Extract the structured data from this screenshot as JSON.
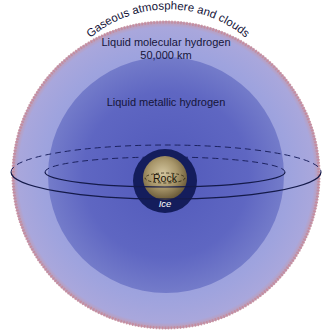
{
  "diagram": {
    "labels": {
      "atmosphere": "Gaseous atmosphere and clouds",
      "molecular": "Liquid molecular hydrogen",
      "depth": "50,000 km",
      "metallic": "Liquid metallic hydrogen",
      "rock": "Rock",
      "ice": "Ice"
    },
    "layers": [
      {
        "name": "Gaseous atmosphere and clouds",
        "color": "#c48a9a"
      },
      {
        "name": "Liquid molecular hydrogen",
        "color": "#9a9fdc"
      },
      {
        "name": "Liquid metallic hydrogen",
        "color": "#5f66c2"
      },
      {
        "name": "Ice",
        "color": "#141d5c"
      },
      {
        "name": "Rock",
        "color": "#9c8a5c"
      }
    ]
  }
}
